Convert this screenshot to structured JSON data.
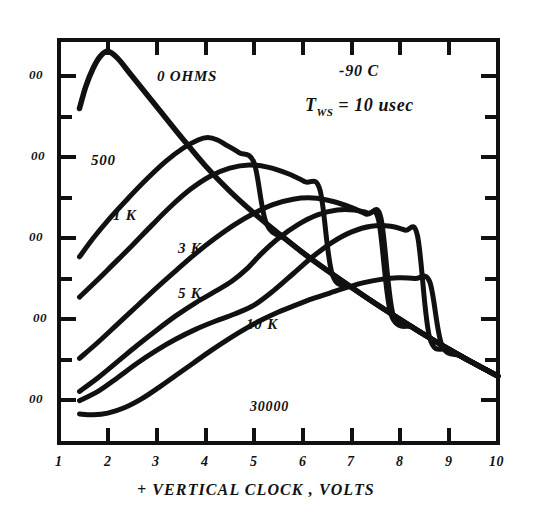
{
  "chart_data": {
    "type": "line",
    "title": "",
    "xlabel": "+ VERTICAL CLOCK , VOLTS",
    "ylabel": "",
    "xlim": [
      1,
      10
    ],
    "ylim": [
      0,
      10
    ],
    "grid": false,
    "legend_position": "inline-curve-labels",
    "x_ticks": [
      "1",
      "2",
      "3",
      "4",
      "5",
      "6",
      "7",
      "8",
      "9",
      "10"
    ],
    "x_tick_values": [
      1,
      2,
      3,
      4,
      5,
      6,
      7,
      8,
      9,
      10
    ],
    "y_ticks": [
      "00",
      "00",
      "00",
      "00",
      "00"
    ],
    "y_tick_note": "y-axis numerals are clipped by the left edge of the scan; only the trailing '00' of each label is visible",
    "y_tick_values": [
      9,
      7,
      5,
      3,
      1
    ],
    "y_minor_tick_values": [
      10,
      8,
      6,
      4,
      2,
      0
    ],
    "annotations": [
      {
        "text": "-90 C",
        "x": 7.0,
        "y": 9.2
      },
      {
        "text": "T_WS = 10 usec",
        "x": 6.9,
        "y": 8.3
      }
    ],
    "series": [
      {
        "name": "0 OHMS",
        "label": "0 OHMS",
        "label_x": 3.0,
        "label_y": 9.2,
        "points": [
          [
            1.42,
            8.3
          ],
          [
            1.55,
            8.85
          ],
          [
            1.7,
            9.3
          ],
          [
            1.85,
            9.6
          ],
          [
            2.0,
            9.72
          ],
          [
            2.2,
            9.55
          ],
          [
            2.5,
            9.1
          ],
          [
            3.0,
            8.35
          ],
          [
            3.5,
            7.6
          ],
          [
            4.0,
            6.88
          ],
          [
            4.5,
            6.25
          ],
          [
            5.0,
            5.7
          ],
          [
            5.5,
            5.2
          ],
          [
            6.0,
            4.72
          ],
          [
            6.5,
            4.28
          ],
          [
            7.0,
            3.86
          ],
          [
            7.5,
            3.45
          ],
          [
            8.0,
            3.06
          ],
          [
            8.5,
            2.68
          ],
          [
            9.0,
            2.32
          ],
          [
            9.5,
            1.98
          ],
          [
            10.0,
            1.66
          ]
        ]
      },
      {
        "name": "500",
        "label": "500",
        "label_x": 1.85,
        "label_y": 6.62,
        "points": [
          [
            1.42,
            4.62
          ],
          [
            1.7,
            5.08
          ],
          [
            2.0,
            5.52
          ],
          [
            2.4,
            6.05
          ],
          [
            2.8,
            6.55
          ],
          [
            3.2,
            7.0
          ],
          [
            3.55,
            7.32
          ],
          [
            3.85,
            7.52
          ],
          [
            4.05,
            7.58
          ],
          [
            4.25,
            7.52
          ],
          [
            4.45,
            7.38
          ],
          [
            4.7,
            7.2
          ],
          [
            5.0,
            6.95
          ]
        ],
        "merges_into_envelope_at_x": 5.0
      },
      {
        "name": "1 K",
        "label": "1 K",
        "label_x": 2.3,
        "label_y": 5.7,
        "points": [
          [
            1.42,
            3.62
          ],
          [
            1.75,
            4.0
          ],
          [
            2.1,
            4.42
          ],
          [
            2.5,
            4.9
          ],
          [
            2.9,
            5.4
          ],
          [
            3.3,
            5.88
          ],
          [
            3.7,
            6.3
          ],
          [
            4.1,
            6.62
          ],
          [
            4.5,
            6.82
          ],
          [
            4.9,
            6.9
          ],
          [
            5.3,
            6.84
          ],
          [
            5.7,
            6.68
          ],
          [
            6.05,
            6.48
          ],
          [
            6.35,
            6.28
          ]
        ],
        "merges_into_envelope_at_x": 6.35
      },
      {
        "name": "3 K",
        "label": "3 K",
        "label_x": 3.55,
        "label_y": 5.02,
        "points": [
          [
            1.42,
            2.1
          ],
          [
            1.8,
            2.5
          ],
          [
            2.2,
            2.95
          ],
          [
            2.6,
            3.4
          ],
          [
            3.0,
            3.85
          ],
          [
            3.4,
            4.28
          ],
          [
            3.8,
            4.7
          ],
          [
            4.2,
            5.08
          ],
          [
            4.6,
            5.42
          ],
          [
            5.0,
            5.7
          ],
          [
            5.4,
            5.92
          ],
          [
            5.8,
            6.05
          ],
          [
            6.2,
            6.08
          ],
          [
            6.6,
            6.0
          ],
          [
            7.0,
            5.84
          ],
          [
            7.3,
            5.68
          ],
          [
            7.55,
            5.54
          ]
        ],
        "merges_into_envelope_at_x": 7.55
      },
      {
        "name": "5 K",
        "label": "5 K",
        "label_x": 3.55,
        "label_y": 3.9,
        "points": [
          [
            1.42,
            1.28
          ],
          [
            1.8,
            1.62
          ],
          [
            2.2,
            2.02
          ],
          [
            2.6,
            2.42
          ],
          [
            3.0,
            2.8
          ],
          [
            3.4,
            3.16
          ],
          [
            3.8,
            3.48
          ],
          [
            4.2,
            3.76
          ],
          [
            4.55,
            4.02
          ],
          [
            4.85,
            4.32
          ],
          [
            5.15,
            4.7
          ],
          [
            5.5,
            5.08
          ],
          [
            5.9,
            5.42
          ],
          [
            6.3,
            5.66
          ],
          [
            6.7,
            5.78
          ],
          [
            7.05,
            5.78
          ],
          [
            7.35,
            5.7
          ],
          [
            7.6,
            5.58
          ]
        ],
        "merges_into_envelope_at_x": 7.6
      },
      {
        "name": "10 K",
        "label": "10 K",
        "label_x": 4.95,
        "label_y": 3.18,
        "points": [
          [
            1.42,
            1.05
          ],
          [
            1.8,
            1.28
          ],
          [
            2.2,
            1.62
          ],
          [
            2.6,
            1.98
          ],
          [
            3.0,
            2.3
          ],
          [
            3.4,
            2.58
          ],
          [
            3.8,
            2.82
          ],
          [
            4.2,
            3.02
          ],
          [
            4.6,
            3.2
          ],
          [
            5.0,
            3.42
          ],
          [
            5.4,
            3.78
          ],
          [
            5.8,
            4.2
          ],
          [
            6.2,
            4.62
          ],
          [
            6.6,
            4.98
          ],
          [
            7.0,
            5.24
          ],
          [
            7.4,
            5.38
          ],
          [
            7.8,
            5.38
          ],
          [
            8.1,
            5.28
          ],
          [
            8.35,
            5.14
          ]
        ],
        "merges_into_envelope_at_x": 8.35
      },
      {
        "name": "30000",
        "label": "30000",
        "label_x": 5.15,
        "label_y": 1.1,
        "points": [
          [
            1.42,
            0.72
          ],
          [
            1.7,
            0.7
          ],
          [
            2.0,
            0.74
          ],
          [
            2.35,
            0.88
          ],
          [
            2.7,
            1.1
          ],
          [
            3.05,
            1.38
          ],
          [
            3.4,
            1.68
          ],
          [
            3.75,
            1.98
          ],
          [
            4.1,
            2.28
          ],
          [
            4.45,
            2.56
          ],
          [
            4.8,
            2.82
          ],
          [
            5.15,
            3.05
          ],
          [
            5.5,
            3.25
          ],
          [
            5.85,
            3.42
          ],
          [
            6.2,
            3.58
          ],
          [
            6.55,
            3.72
          ],
          [
            6.9,
            3.86
          ],
          [
            7.25,
            3.98
          ],
          [
            7.6,
            4.06
          ],
          [
            7.95,
            4.1
          ],
          [
            8.3,
            4.08
          ],
          [
            8.6,
            4.0
          ]
        ],
        "merges_into_envelope_at_x": 8.6
      }
    ]
  },
  "axis": {
    "x_title": "+ VERTICAL CLOCK , VOLTS",
    "x_labels": [
      "1",
      "2",
      "3",
      "4",
      "5",
      "6",
      "7",
      "8",
      "9",
      "10"
    ],
    "y_labels": [
      "00",
      "00",
      "00",
      "00",
      "00"
    ]
  },
  "annotations": {
    "temperature": "-90 C",
    "pulse_prefix": "T",
    "pulse_subscript": "WS",
    "pulse_rest": " = 10 usec"
  },
  "curve_labels": {
    "c0": "0 OHMS",
    "c1": "500",
    "c2": "1 K",
    "c3": "3 K",
    "c4": "5 K",
    "c5": "10 K",
    "c6": "30000"
  },
  "colors": {
    "ink": "#111111",
    "background": "#ffffff"
  }
}
